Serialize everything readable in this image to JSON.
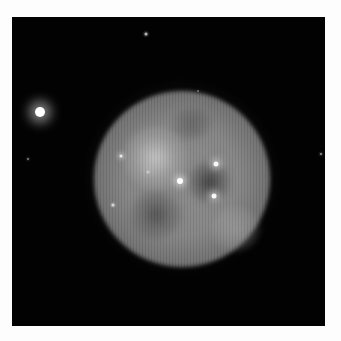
{
  "image": {
    "subject": "planetary nebula (grayscale telescope image)",
    "background_color": "#020202",
    "frame_color": "#fdfdfd"
  },
  "nebula": {
    "center": [
      182,
      180
    ],
    "radius": 87,
    "features": [
      {
        "name": "bright-lobe-upper-left",
        "center": [
          155,
          158
        ]
      },
      {
        "name": "dark-eye-right",
        "center": [
          200,
          180
        ]
      },
      {
        "name": "dark-eye-lower-left",
        "center": [
          150,
          210
        ]
      }
    ]
  },
  "stars": [
    {
      "name": "bright-star-left",
      "x": 40,
      "y": 112,
      "size": 10,
      "glow": 6,
      "brightness": 1.0
    },
    {
      "name": "star-top",
      "x": 146,
      "y": 34,
      "size": 3,
      "glow": 1,
      "brightness": 0.7
    },
    {
      "name": "star-far-left",
      "x": 28,
      "y": 159,
      "size": 2,
      "glow": 1,
      "brightness": 0.5
    },
    {
      "name": "star-far-right",
      "x": 321,
      "y": 154,
      "size": 2,
      "glow": 1,
      "brightness": 0.6
    },
    {
      "name": "star-nebula-top",
      "x": 198,
      "y": 91,
      "size": 2,
      "glow": 0,
      "brightness": 0.4
    },
    {
      "name": "star-nebula-left",
      "x": 121,
      "y": 156,
      "size": 3,
      "glow": 2,
      "brightness": 0.85
    },
    {
      "name": "star-nebula-faint",
      "x": 148,
      "y": 172,
      "size": 3,
      "glow": 3,
      "brightness": 0.45
    },
    {
      "name": "star-central",
      "x": 180,
      "y": 181,
      "size": 6,
      "glow": 3,
      "brightness": 1.0
    },
    {
      "name": "star-upper-right",
      "x": 216,
      "y": 164,
      "size": 5,
      "glow": 3,
      "brightness": 0.95
    },
    {
      "name": "star-lower-right",
      "x": 214,
      "y": 196,
      "size": 5,
      "glow": 3,
      "brightness": 0.95
    },
    {
      "name": "star-lower-left",
      "x": 113,
      "y": 205,
      "size": 3,
      "glow": 1,
      "brightness": 0.7
    }
  ]
}
